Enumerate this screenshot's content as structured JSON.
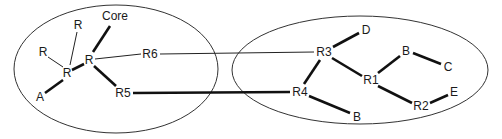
{
  "diagram": {
    "type": "network-topology",
    "regions": [
      {
        "id": "left",
        "cx": 116,
        "cy": 69,
        "rx": 102,
        "ry": 64
      },
      {
        "id": "right",
        "cx": 360,
        "cy": 70,
        "rx": 128,
        "ry": 54
      }
    ],
    "nodes": [
      {
        "id": "core",
        "label": "Core",
        "x": 115,
        "y": 16
      },
      {
        "id": "r_top",
        "label": "R",
        "x": 78,
        "y": 25
      },
      {
        "id": "r_left",
        "label": "R",
        "x": 43,
        "y": 52
      },
      {
        "id": "r_mid",
        "label": "R",
        "x": 67,
        "y": 73
      },
      {
        "id": "r_hub",
        "label": "R",
        "x": 89,
        "y": 60
      },
      {
        "id": "a",
        "label": "A",
        "x": 40,
        "y": 97
      },
      {
        "id": "r6",
        "label": "R6",
        "x": 150,
        "y": 54
      },
      {
        "id": "r5",
        "label": "R5",
        "x": 123,
        "y": 93
      },
      {
        "id": "r3",
        "label": "R3",
        "x": 324,
        "y": 52
      },
      {
        "id": "d",
        "label": "D",
        "x": 366,
        "y": 30
      },
      {
        "id": "r4",
        "label": "R4",
        "x": 300,
        "y": 92
      },
      {
        "id": "r1",
        "label": "R1",
        "x": 371,
        "y": 80
      },
      {
        "id": "b_top",
        "label": "B",
        "x": 406,
        "y": 51
      },
      {
        "id": "c",
        "label": "C",
        "x": 448,
        "y": 67
      },
      {
        "id": "r2",
        "label": "R2",
        "x": 421,
        "y": 106
      },
      {
        "id": "e",
        "label": "E",
        "x": 454,
        "y": 92
      },
      {
        "id": "b_bot",
        "label": "B",
        "x": 357,
        "y": 117
      }
    ],
    "links": [
      {
        "from": "r_hub",
        "to": "core",
        "weight": "thick",
        "x1": 93,
        "y1": 52,
        "x2": 110,
        "y2": 26
      },
      {
        "from": "r_mid",
        "to": "r_top",
        "weight": "thin",
        "x1": 70,
        "y1": 65,
        "x2": 77,
        "y2": 32
      },
      {
        "from": "r_mid",
        "to": "r_left",
        "weight": "thin",
        "x1": 63,
        "y1": 67,
        "x2": 48,
        "y2": 57
      },
      {
        "from": "r_mid",
        "to": "r_hub",
        "weight": "thick",
        "x1": 72,
        "y1": 70,
        "x2": 84,
        "y2": 64
      },
      {
        "from": "a",
        "to": "r_mid",
        "weight": "thick",
        "x1": 45,
        "y1": 93,
        "x2": 63,
        "y2": 80
      },
      {
        "from": "r_hub",
        "to": "r6",
        "weight": "thin",
        "x1": 95,
        "y1": 59,
        "x2": 141,
        "y2": 54
      },
      {
        "from": "r_hub",
        "to": "r5",
        "weight": "thick",
        "x1": 94,
        "y1": 66,
        "x2": 116,
        "y2": 86
      },
      {
        "from": "r6",
        "to": "r3",
        "weight": "thin",
        "x1": 160,
        "y1": 54,
        "x2": 314,
        "y2": 52
      },
      {
        "from": "r5",
        "to": "r4",
        "weight": "thick",
        "x1": 133,
        "y1": 93,
        "x2": 290,
        "y2": 92
      },
      {
        "from": "r3",
        "to": "d",
        "weight": "thick",
        "x1": 333,
        "y1": 47,
        "x2": 359,
        "y2": 33
      },
      {
        "from": "r3",
        "to": "r4",
        "weight": "thick",
        "x1": 320,
        "y1": 60,
        "x2": 304,
        "y2": 84
      },
      {
        "from": "r3",
        "to": "r1",
        "weight": "thick",
        "x1": 332,
        "y1": 58,
        "x2": 362,
        "y2": 76
      },
      {
        "from": "r1",
        "to": "b_top",
        "weight": "thick",
        "x1": 378,
        "y1": 73,
        "x2": 400,
        "y2": 56
      },
      {
        "from": "b_top",
        "to": "c",
        "weight": "thick",
        "x1": 413,
        "y1": 53,
        "x2": 441,
        "y2": 64
      },
      {
        "from": "r1",
        "to": "r2",
        "weight": "thick",
        "x1": 378,
        "y1": 86,
        "x2": 412,
        "y2": 103
      },
      {
        "from": "r2",
        "to": "e",
        "weight": "thick",
        "x1": 430,
        "y1": 103,
        "x2": 448,
        "y2": 95
      },
      {
        "from": "r4",
        "to": "b_bot",
        "weight": "thick",
        "x1": 309,
        "y1": 96,
        "x2": 350,
        "y2": 113
      }
    ]
  }
}
